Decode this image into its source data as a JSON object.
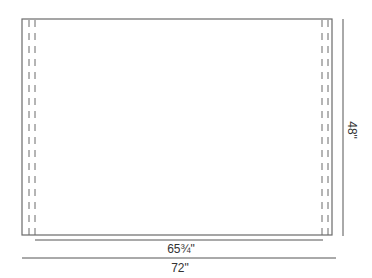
{
  "diagram": {
    "type": "dimension-drawing",
    "colors": {
      "stroke": "#666666",
      "dim_stroke": "#555555",
      "text": "#333333",
      "background": "#ffffff"
    },
    "dimensions": {
      "height_label": "48\"",
      "inner_width_label": "65¾\"",
      "overall_width_label": "72\""
    },
    "geometry": {
      "rect": {
        "x": 22,
        "y": 19,
        "w": 310,
        "h": 216
      },
      "left_dashes_x": [
        29,
        35
      ],
      "right_dashes_x": [
        322,
        328
      ],
      "height_line": {
        "x": 343,
        "y1": 19,
        "y2": 236
      },
      "inner_width_line": {
        "y": 240,
        "x1": 35,
        "x2": 323
      },
      "overall_width_line": {
        "y": 258,
        "x1": 22,
        "x2": 336
      }
    }
  }
}
